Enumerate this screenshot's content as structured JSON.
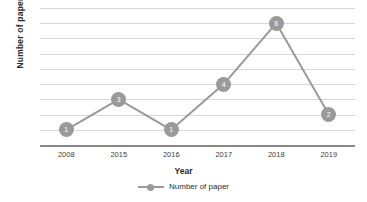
{
  "chart_data": {
    "type": "line",
    "title": "",
    "xlabel": "Year",
    "ylabel": "Number of paper",
    "categories": [
      "2008",
      "2015",
      "2016",
      "2017",
      "2018",
      "2019"
    ],
    "series": [
      {
        "name": "Number of paper",
        "values": [
          1,
          3,
          1,
          4,
          8,
          2
        ],
        "color": "#9a9a9a",
        "marker": "circle",
        "data_labels": [
          "1",
          "3",
          "1",
          "4",
          "8",
          "2"
        ]
      }
    ],
    "ylim": [
      0,
      9
    ],
    "y_tick_labels": [],
    "gridlines": 9,
    "grid": true,
    "legend": {
      "position": "bottom",
      "entries": [
        "Number of paper"
      ]
    }
  },
  "legend": {
    "symbol_name": "line-marker-symbol",
    "label": "Number of paper"
  },
  "axes": {
    "y_title": "Number of paper",
    "x_title": "Year"
  }
}
